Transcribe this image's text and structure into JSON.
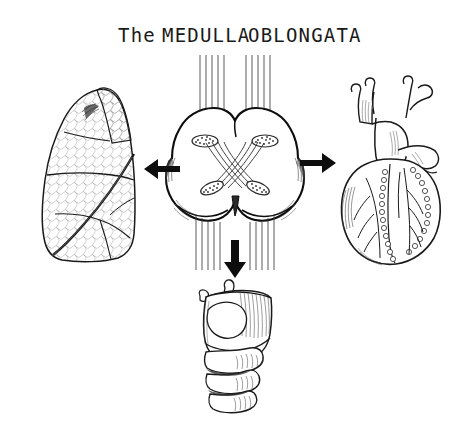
{
  "figure": {
    "title": "The MEDULLA  OBLONGATA",
    "title_parts": {
      "article": "The",
      "word1": "MEDULLA",
      "word2": "OBLONGATA"
    },
    "background_color": "#ffffff",
    "ink_color": "#1a1a1a",
    "style": "pen-and-ink anatomical line drawing"
  },
  "center": {
    "label": "medulla-oblongata-cross-section",
    "description": "Clover-shaped transverse section of the medulla oblongata with pyramidal decussation",
    "nuclei_count": 4,
    "fiber_bundles": {
      "top_left_count": 5,
      "top_right_count": 5,
      "bottom_left_count": 5,
      "bottom_right_count": 5,
      "crossing_fibers": 4
    }
  },
  "arrows": [
    {
      "name": "arrow-to-lung",
      "direction": "left",
      "color": "#0d0d0d"
    },
    {
      "name": "arrow-to-heart",
      "direction": "right",
      "color": "#0d0d0d"
    },
    {
      "name": "arrow-to-larynx",
      "direction": "down",
      "color": "#0d0d0d"
    }
  ],
  "organs": {
    "lung": {
      "label": "lung",
      "position": "left",
      "description": "Lung with lobar fissures and stippled alveolar texture"
    },
    "heart": {
      "label": "heart",
      "position": "right",
      "description": "Heart with aorta, pulmonary trunk, vena cava and coronary vessels"
    },
    "larynx": {
      "label": "larynx-and-trachea",
      "position": "bottom",
      "description": "Larynx with epiglottis, thyroid and cricoid cartilage and tracheal rings"
    }
  }
}
